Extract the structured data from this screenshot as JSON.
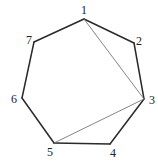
{
  "diagram": {
    "type": "heptagon-with-diagonals",
    "colors": {
      "edge": "#2a2a2a",
      "diagonal": "#777777",
      "label": "#222222",
      "background": "#ffffff"
    },
    "vertices": [
      {
        "id": "1",
        "label": "1",
        "x": 84,
        "y": 19,
        "lx": 84,
        "ly": 14
      },
      {
        "id": "2",
        "label": "2",
        "x": 134,
        "y": 43,
        "lx": 139,
        "ly": 45
      },
      {
        "id": "3",
        "label": "3",
        "x": 144,
        "y": 99,
        "lx": 152,
        "ly": 104
      },
      {
        "id": "4",
        "label": "4",
        "x": 110,
        "y": 144,
        "lx": 113,
        "ly": 157
      },
      {
        "id": "5",
        "label": "5",
        "x": 54,
        "y": 143,
        "lx": 50,
        "ly": 156
      },
      {
        "id": "6",
        "label": "6",
        "x": 22,
        "y": 98,
        "lx": 14,
        "ly": 103
      },
      {
        "id": "7",
        "label": "7",
        "x": 34,
        "y": 42,
        "lx": 29,
        "ly": 44
      }
    ],
    "edges": [
      [
        "1",
        "2"
      ],
      [
        "2",
        "3"
      ],
      [
        "3",
        "4"
      ],
      [
        "4",
        "5"
      ],
      [
        "5",
        "6"
      ],
      [
        "6",
        "7"
      ],
      [
        "7",
        "1"
      ]
    ],
    "diagonals": [
      [
        "1",
        "3"
      ],
      [
        "3",
        "5"
      ]
    ]
  }
}
